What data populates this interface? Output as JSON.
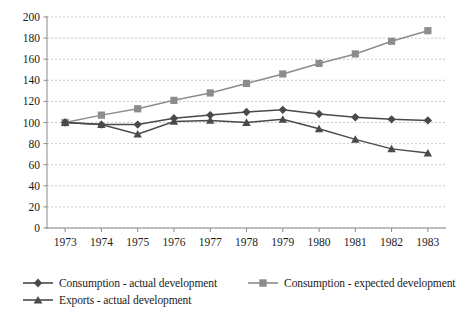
{
  "chart_data": {
    "type": "line",
    "title": "",
    "xlabel": "",
    "ylabel": "",
    "categories": [
      "1973",
      "1974",
      "1975",
      "1976",
      "1977",
      "1978",
      "1979",
      "1980",
      "1981",
      "1982",
      "1983"
    ],
    "ylim": [
      0,
      200
    ],
    "ytick_step": 20,
    "yticks": [
      "0",
      "20",
      "40",
      "60",
      "80",
      "100",
      "120",
      "140",
      "160",
      "180",
      "200"
    ],
    "grid": true,
    "grid_axis": "y",
    "legend_position": "bottom-left",
    "series": [
      {
        "name": "Consumption - actual development",
        "marker": "diamond",
        "color": "#4a4a4a",
        "values": [
          100,
          98,
          98,
          104,
          107,
          110,
          112,
          108,
          105,
          103,
          102
        ]
      },
      {
        "name": "Consumption - expected development",
        "marker": "square",
        "color": "#8c8c8c",
        "values": [
          100,
          107,
          113,
          121,
          128,
          137,
          146,
          156,
          165,
          177,
          187
        ]
      },
      {
        "name": "Exports - actual development",
        "marker": "triangle",
        "color": "#4a4a4a",
        "values": [
          100,
          98,
          89,
          101,
          102,
          100,
          103,
          94,
          84,
          75,
          71
        ]
      }
    ]
  },
  "legend": {
    "items": [
      {
        "label": "Consumption - actual development"
      },
      {
        "label": "Consumption - expected development"
      },
      {
        "label": "Exports - actual development"
      }
    ]
  },
  "colors": {
    "axis": "#8a8a8a",
    "grid": "#c9c9c9",
    "dark_series": "#4a4a4a",
    "gray_series": "#8c8c8c",
    "text": "#1b1b1b",
    "background": "#ffffff"
  }
}
